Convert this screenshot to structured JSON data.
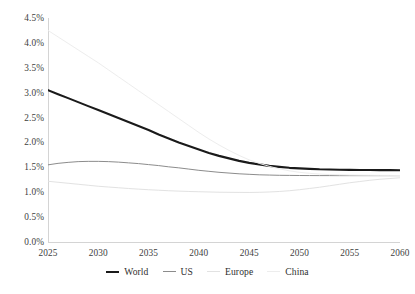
{
  "chart_data": {
    "type": "line",
    "title": "",
    "subtitle": "",
    "xlabel": "",
    "ylabel": "",
    "xlim": [
      2025,
      2060
    ],
    "ylim": [
      0.0,
      4.5
    ],
    "grid": false,
    "legend_position": "bottom",
    "x_ticks": [
      "2025",
      "2030",
      "2035",
      "2040",
      "2045",
      "2050",
      "2055",
      "2060"
    ],
    "y_ticks": [
      "0.0%",
      "0.5%",
      "1.0%",
      "1.5%",
      "2.0%",
      "2.5%",
      "3.0%",
      "3.5%",
      "4.0%",
      "4.5%"
    ],
    "x": [
      2025,
      2026,
      2027,
      2028,
      2029,
      2030,
      2031,
      2032,
      2033,
      2034,
      2035,
      2036,
      2037,
      2038,
      2039,
      2040,
      2041,
      2042,
      2043,
      2044,
      2045,
      2046,
      2047,
      2048,
      2049,
      2050,
      2051,
      2052,
      2053,
      2054,
      2055,
      2056,
      2057,
      2058,
      2059,
      2060
    ],
    "series": [
      {
        "name": "World",
        "color": "#1a1a1a",
        "width": 2.1,
        "values": [
          3.05,
          2.97,
          2.89,
          2.81,
          2.73,
          2.65,
          2.57,
          2.49,
          2.41,
          2.33,
          2.25,
          2.16,
          2.08,
          2.0,
          1.93,
          1.86,
          1.79,
          1.73,
          1.68,
          1.63,
          1.59,
          1.56,
          1.53,
          1.51,
          1.49,
          1.48,
          1.47,
          1.46,
          1.455,
          1.45,
          1.448,
          1.446,
          1.445,
          1.444,
          1.443,
          1.442
        ]
      },
      {
        "name": "US",
        "color": "#8c8c8c",
        "width": 1.0,
        "values": [
          1.55,
          1.58,
          1.6,
          1.615,
          1.62,
          1.62,
          1.615,
          1.605,
          1.59,
          1.575,
          1.555,
          1.535,
          1.51,
          1.49,
          1.465,
          1.44,
          1.42,
          1.4,
          1.385,
          1.37,
          1.36,
          1.35,
          1.345,
          1.34,
          1.338,
          1.336,
          1.335,
          1.334,
          1.334,
          1.333,
          1.333,
          1.333,
          1.333,
          1.333,
          1.333,
          1.333
        ]
      },
      {
        "name": "Europe",
        "color": "#e2e2e2",
        "width": 1.0,
        "values": [
          1.22,
          1.2,
          1.18,
          1.16,
          1.14,
          1.12,
          1.105,
          1.09,
          1.075,
          1.062,
          1.05,
          1.04,
          1.03,
          1.022,
          1.015,
          1.01,
          1.005,
          1.0,
          0.998,
          0.996,
          0.995,
          0.998,
          1.005,
          1.015,
          1.03,
          1.05,
          1.075,
          1.1,
          1.13,
          1.16,
          1.19,
          1.215,
          1.24,
          1.26,
          1.275,
          1.29
        ]
      },
      {
        "name": "China",
        "color": "#ededed",
        "width": 1.0,
        "values": [
          4.25,
          4.12,
          3.99,
          3.86,
          3.73,
          3.6,
          3.46,
          3.32,
          3.18,
          3.04,
          2.9,
          2.76,
          2.62,
          2.48,
          2.34,
          2.2,
          2.07,
          1.95,
          1.84,
          1.74,
          1.65,
          1.58,
          1.52,
          1.47,
          1.43,
          1.4,
          1.38,
          1.365,
          1.355,
          1.35,
          1.345,
          1.342,
          1.34,
          1.338,
          1.337,
          1.336
        ]
      }
    ],
    "legend": [
      {
        "label": "World",
        "color": "#1a1a1a",
        "width": 2.1
      },
      {
        "label": "US",
        "color": "#8c8c8c",
        "width": 1.0
      },
      {
        "label": "Europe",
        "color": "#e2e2e2",
        "width": 1.0
      },
      {
        "label": "China",
        "color": "#ededed",
        "width": 1.0
      }
    ],
    "axis_color": "#d4d4d4"
  }
}
